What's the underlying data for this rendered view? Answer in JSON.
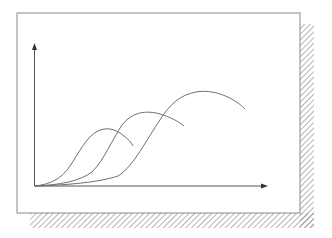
{
  "diagram": {
    "colors": {
      "background": "#ffffff",
      "frame": "#8a8a8a",
      "axis": "#555555",
      "curve": "#6e6e6e",
      "hatch": "#777777"
    },
    "axes": {
      "x_label": "",
      "y_label": "",
      "has_arrows": true
    },
    "curves": [
      {
        "name": "curve-1",
        "peak_order": 1
      },
      {
        "name": "curve-2",
        "peak_order": 2
      },
      {
        "name": "curve-3",
        "peak_order": 3
      }
    ]
  }
}
